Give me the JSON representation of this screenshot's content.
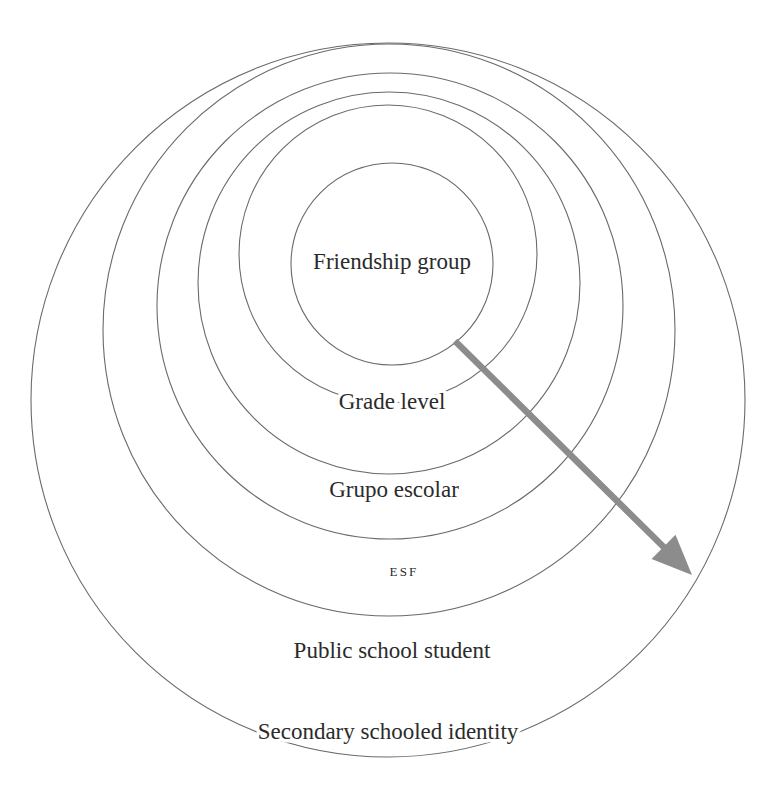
{
  "diagram": {
    "type": "nested-circles",
    "background_color": "#ffffff",
    "ring_stroke_color": "#6a6a6a",
    "label_color": "#2b2b2b",
    "arrow_color": "#8c8c8c",
    "rings": [
      {
        "order": 1,
        "level": "innermost",
        "label": "Friendship group",
        "label_style": "large",
        "cx": 392,
        "cy": 264,
        "r": 101,
        "label_x": 392,
        "label_y": 264
      },
      {
        "order": 2,
        "level": "second",
        "label": "Grade level",
        "label_style": "large",
        "cx": 388,
        "cy": 254,
        "r": 149,
        "label_x": 392,
        "label_y": 404
      },
      {
        "order": 3,
        "level": "third",
        "label": "Grupo escolar",
        "label_style": "large",
        "cx": 389,
        "cy": 283,
        "r": 191,
        "label_x": 394,
        "label_y": 492
      },
      {
        "order": 4,
        "level": "fourth",
        "label": "ESF",
        "label_style": "small-caps",
        "cx": 390,
        "cy": 306,
        "r": 233,
        "label_x": 404,
        "label_y": 573
      },
      {
        "order": 5,
        "level": "fifth",
        "label": "Public school student",
        "label_style": "large",
        "cx": 389,
        "cy": 330,
        "r": 286,
        "label_x": 392,
        "label_y": 653
      },
      {
        "order": 6,
        "level": "outermost",
        "label": "Secondary schooled identity",
        "label_style": "large",
        "cx": 388,
        "cy": 400,
        "r": 357,
        "label_x": 388,
        "label_y": 734
      }
    ],
    "arrow": {
      "name": "outward-direction-arrow",
      "from_x": 455,
      "from_y": 341,
      "to_x": 692,
      "to_y": 575,
      "color": "#8c8c8c",
      "shaft_width": 6.5,
      "head_length": 40,
      "head_width": 34
    }
  }
}
